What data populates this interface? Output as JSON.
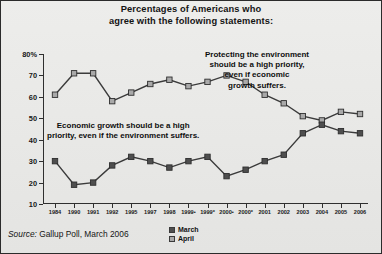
{
  "title": {
    "line1": "Percentages of Americans who",
    "line2": "agree with the following statements:"
  },
  "source": {
    "label": "Source:",
    "text": " Gallup Poll, March 2006"
  },
  "legend": {
    "items": [
      {
        "label": "March",
        "color": "#4e4e4e"
      },
      {
        "label": "April",
        "color": "#a9a9a9"
      }
    ]
  },
  "annotations": {
    "environment": [
      "Protecting the environment",
      "should be a high priority,",
      "even if economic",
      "growth suffers."
    ],
    "economy": [
      "Economic growth should be a high",
      "priority, even if the environment suffers."
    ]
  },
  "chart_data": {
    "type": "line",
    "title": "Percentages of Americans who agree with the following statements:",
    "xlabel": "",
    "ylabel": "",
    "ylim": [
      10,
      80
    ],
    "yticks": [
      10,
      20,
      30,
      40,
      50,
      60,
      70,
      80
    ],
    "ytick_labels": [
      "10",
      "20",
      "30",
      "40",
      "50",
      "60",
      "70",
      "80%"
    ],
    "grid": false,
    "legend_position": "bottom-center",
    "categories": [
      "1984",
      "1990",
      "1991",
      "1992",
      "1995",
      "1997",
      "1998",
      "1999•",
      "1999*",
      "2000•",
      "2000*",
      "2001",
      "2002",
      "2003",
      "2004",
      "2005",
      "2006"
    ],
    "series": [
      {
        "name": "April",
        "color": "#a9a9a9",
        "label": "Protecting the environment should be a high priority, even if economic growth suffers.",
        "values": [
          61,
          71,
          71,
          58,
          62,
          66,
          68,
          65,
          67,
          70,
          67,
          61,
          57,
          51,
          49,
          53,
          52
        ]
      },
      {
        "name": "March",
        "color": "#4e4e4e",
        "label": "Economic growth should be a high priority, even if the environment suffers.",
        "values": [
          30,
          19,
          20,
          28,
          32,
          30,
          27,
          30,
          32,
          23,
          26,
          30,
          33,
          43,
          47,
          44,
          43
        ]
      }
    ]
  }
}
